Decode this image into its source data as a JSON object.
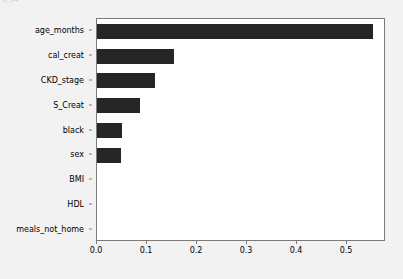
{
  "figure": {
    "top_fragment_text": "0.54",
    "background_color": "#f2f2f2",
    "plot_background_color": "#ffffff",
    "bar_color": "#262626",
    "axis_color": "#7a7a7a"
  },
  "chart_data": {
    "type": "bar",
    "orientation": "horizontal",
    "title": "",
    "xlabel": "",
    "ylabel": "",
    "categories": [
      "age_months",
      "cal_creat",
      "CKD_stage",
      "S_Creat",
      "black",
      "sex",
      "BMI",
      "HDL",
      "meals_not_home"
    ],
    "values": [
      0.552,
      0.154,
      0.116,
      0.086,
      0.05,
      0.047,
      0.0,
      0.0,
      0.0
    ],
    "xlim": [
      0.0,
      0.578
    ],
    "xticks": [
      0.0,
      0.1,
      0.2,
      0.3,
      0.4,
      0.5
    ],
    "xtick_labels": [
      "0.0",
      "0.1",
      "0.2",
      "0.3",
      "0.4",
      "0.5"
    ],
    "grid": false,
    "legend": null
  }
}
